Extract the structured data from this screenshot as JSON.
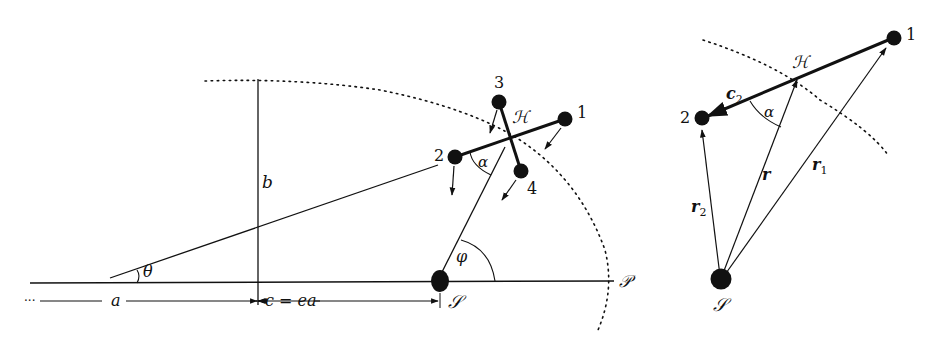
{
  "left_diagram": {
    "labels": {
      "b": "b",
      "theta": "θ",
      "alpha": "α",
      "phi": "φ",
      "H": "ℋ",
      "S": "𝒮",
      "P": "𝒫",
      "a": "a",
      "c_eq": "c = ea",
      "dots": "···"
    },
    "points": [
      {
        "id": "1",
        "label": "1"
      },
      {
        "id": "2",
        "label": "2"
      },
      {
        "id": "3",
        "label": "3"
      },
      {
        "id": "4",
        "label": "4"
      }
    ]
  },
  "right_diagram": {
    "labels": {
      "H": "ℋ",
      "S": "𝒮",
      "alpha": "α",
      "c2": "c",
      "c2_sub": "2",
      "r": "r",
      "r1": "r",
      "r1_sub": "1",
      "r2": "r",
      "r2_sub": "2"
    },
    "points": [
      {
        "id": "1",
        "label": "1"
      },
      {
        "id": "2",
        "label": "2"
      }
    ]
  },
  "colors": {
    "ink": "#111111",
    "background": "#ffffff"
  }
}
